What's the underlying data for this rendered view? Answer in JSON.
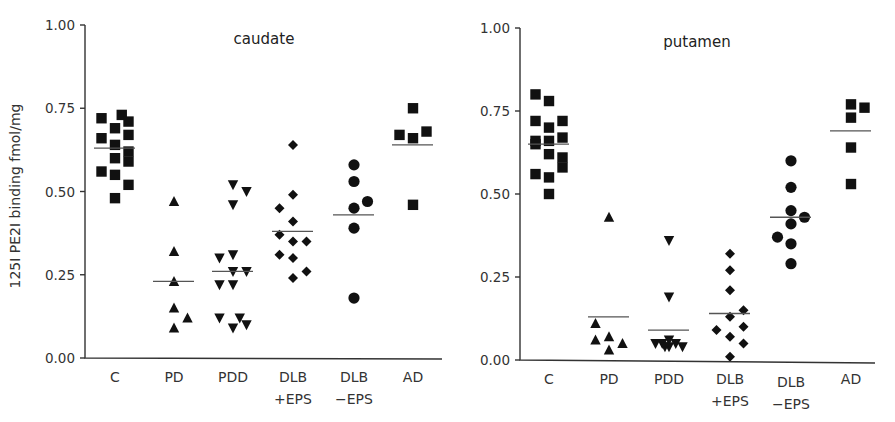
{
  "chart_data": [
    {
      "type": "scatter",
      "title": "caudate",
      "xlabel": "",
      "ylabel": "125I PE2I binding fmol/mg",
      "ylim": [
        0,
        1.0
      ],
      "yticks": [
        "0.00",
        "0.25",
        "0.50",
        "0.75",
        "1.00"
      ],
      "grid": false,
      "categories": [
        "C",
        "PD",
        "PDD",
        "DLB +EPS",
        "DLB −EPS",
        "AD"
      ],
      "series": [
        {
          "name": "C",
          "marker": "square",
          "mean": 0.63,
          "values": [
            0.72,
            0.73,
            0.71,
            0.69,
            0.66,
            0.67,
            0.64,
            0.62,
            0.6,
            0.59,
            0.56,
            0.55,
            0.52,
            0.48
          ],
          "offsets": [
            -1,
            0.5,
            1,
            0,
            -1,
            1,
            0,
            1,
            0,
            1,
            -1,
            0,
            1,
            0
          ]
        },
        {
          "name": "PD",
          "marker": "triangle-up",
          "mean": 0.23,
          "values": [
            0.47,
            0.32,
            0.23,
            0.15,
            0.12,
            0.09
          ],
          "offsets": [
            0,
            0,
            0,
            0,
            1,
            0
          ]
        },
        {
          "name": "PDD",
          "marker": "triangle-down",
          "mean": 0.26,
          "values": [
            0.52,
            0.5,
            0.46,
            0.3,
            0.31,
            0.26,
            0.26,
            0.22,
            0.22,
            0.12,
            0.12,
            0.09,
            0.1
          ],
          "offsets": [
            0,
            1,
            0,
            -1,
            0,
            0,
            1,
            -1,
            0,
            -1,
            0.5,
            0,
            1
          ]
        },
        {
          "name": "DLB +EPS",
          "marker": "diamond",
          "mean": 0.38,
          "values": [
            0.64,
            0.49,
            0.45,
            0.41,
            0.37,
            0.35,
            0.35,
            0.31,
            0.3,
            0.26,
            0.24
          ],
          "offsets": [
            0,
            0,
            -1,
            0,
            -1,
            0,
            1,
            -1,
            0,
            1,
            0
          ]
        },
        {
          "name": "DLB −EPS",
          "marker": "circle",
          "mean": 0.43,
          "values": [
            0.58,
            0.53,
            0.47,
            0.45,
            0.39,
            0.18
          ],
          "offsets": [
            0,
            0,
            1,
            0,
            0,
            0
          ]
        },
        {
          "name": "AD",
          "marker": "square",
          "mean": 0.64,
          "values": [
            0.75,
            0.67,
            0.66,
            0.68,
            0.46
          ],
          "offsets": [
            0,
            -1,
            0,
            1,
            0
          ]
        }
      ]
    },
    {
      "type": "scatter",
      "title": "putamen",
      "xlabel": "",
      "ylabel": "",
      "ylim": [
        0,
        1.0
      ],
      "yticks": [
        "0.00",
        "0.25",
        "0.50",
        "0.75",
        "1.00"
      ],
      "grid": false,
      "categories": [
        "C",
        "PD",
        "PDD",
        "DLB +EPS",
        "DLB −EPS",
        "AD"
      ],
      "series": [
        {
          "name": "C",
          "marker": "square",
          "mean": 0.65,
          "values": [
            0.8,
            0.78,
            0.72,
            0.72,
            0.7,
            0.67,
            0.66,
            0.66,
            0.65,
            0.62,
            0.61,
            0.58,
            0.56,
            0.55,
            0.5
          ],
          "offsets": [
            -1,
            0,
            -1,
            1,
            0,
            1,
            -1,
            0,
            -1,
            0,
            1,
            1,
            -1,
            0,
            0
          ]
        },
        {
          "name": "PD",
          "marker": "triangle-up",
          "mean": 0.13,
          "values": [
            0.43,
            0.11,
            0.07,
            0.06,
            0.05,
            0.03
          ],
          "offsets": [
            0,
            -1,
            0,
            -1,
            1,
            0
          ]
        },
        {
          "name": "PDD",
          "marker": "triangle-down",
          "mean": 0.09,
          "values": [
            0.36,
            0.19,
            0.06,
            0.05,
            0.05,
            0.05,
            0.04,
            0.04,
            0.04
          ],
          "offsets": [
            0,
            0,
            0,
            -1,
            -0.5,
            0.5,
            1,
            0,
            -0.3
          ]
        },
        {
          "name": "DLB +EPS",
          "marker": "diamond",
          "mean": 0.14,
          "values": [
            0.32,
            0.27,
            0.21,
            0.15,
            0.13,
            0.09,
            0.1,
            0.07,
            0.05,
            0.01
          ],
          "offsets": [
            0,
            0,
            0,
            1,
            0,
            -1,
            1,
            0,
            1,
            0
          ]
        },
        {
          "name": "DLB −EPS",
          "marker": "circle",
          "mean": 0.43,
          "values": [
            0.6,
            0.52,
            0.45,
            0.43,
            0.41,
            0.37,
            0.35,
            0.29
          ],
          "offsets": [
            0,
            0,
            0,
            1,
            0,
            -1,
            0,
            0
          ]
        },
        {
          "name": "AD",
          "marker": "square",
          "mean": 0.69,
          "values": [
            0.77,
            0.76,
            0.73,
            0.64,
            0.53
          ],
          "offsets": [
            0,
            1,
            0,
            0,
            0
          ]
        }
      ]
    }
  ],
  "panels": [
    {
      "title": "caudate",
      "ylabel": "125I PE2I binding fmol/mg",
      "categories": [
        [
          "C"
        ],
        [
          "PD"
        ],
        [
          "PDD"
        ],
        [
          "DLB",
          "+EPS"
        ],
        [
          "DLB",
          "−EPS"
        ],
        [
          "AD"
        ]
      ]
    },
    {
      "title": "putamen",
      "ylabel": "",
      "categories": [
        [
          "C"
        ],
        [
          "PD"
        ],
        [
          "PDD"
        ],
        [
          "DLB",
          "+EPS"
        ],
        [
          "DLB",
          "−EPS"
        ],
        [
          "AD"
        ]
      ]
    }
  ]
}
